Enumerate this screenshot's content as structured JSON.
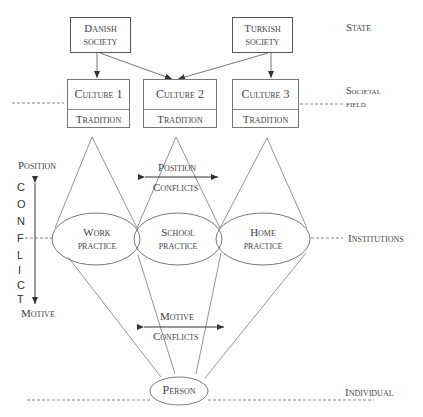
{
  "societies": [
    {
      "id": "danish",
      "line1": "Danish",
      "line2": "society"
    },
    {
      "id": "turkish",
      "line1": "Turkish",
      "line2": "society"
    }
  ],
  "cultures": [
    {
      "culture": "Culture 1",
      "tradition": "Tradition"
    },
    {
      "culture": "Culture 2",
      "tradition": "Tradition"
    },
    {
      "culture": "Culture 3",
      "tradition": "Tradition"
    }
  ],
  "practices": [
    {
      "line1": "Work",
      "line2": "practice"
    },
    {
      "line1": "School",
      "line2": "practice"
    },
    {
      "line1": "Home",
      "line2": "practice"
    }
  ],
  "person": "Person",
  "levels": {
    "state": "State",
    "societal_line1": "Societal",
    "societal_line2": "field",
    "institutions": "Institutions",
    "individual": "Individual"
  },
  "conflict_axis": {
    "top": "Position",
    "bottom": "Motive",
    "letters": [
      "C",
      "O",
      "N",
      "F",
      "L",
      "I",
      "C",
      "T"
    ]
  },
  "position_conflicts": {
    "line1": "Position",
    "line2": "Conflicts"
  },
  "motive_conflicts": {
    "line1": "Motive",
    "line2": "Conflicts"
  },
  "colors": {
    "line": "#555555",
    "text": "#444444"
  }
}
